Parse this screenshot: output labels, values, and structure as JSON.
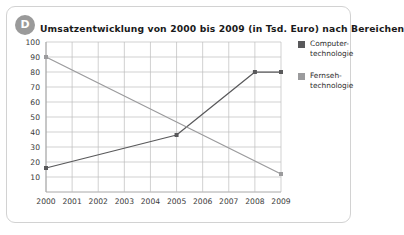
{
  "card": {
    "badge_letter": "D",
    "title": "Umsatzentwicklung von 2000 bis 2009 (in Tsd. Euro) nach Bereichen"
  },
  "legend": {
    "position": "right",
    "entries": [
      {
        "label": "Computer-\ntechnologie",
        "color": "#59595b"
      },
      {
        "label": "Fernseh-\ntechnologie",
        "color": "#9b9b9d"
      }
    ]
  },
  "chart_data": {
    "type": "line",
    "title": "Umsatzentwicklung von 2000 bis 2009 (in Tsd. Euro) nach Bereichen",
    "xlabel": "",
    "ylabel": "",
    "categories": [
      "2000",
      "2001",
      "2002",
      "2003",
      "2004",
      "2005",
      "2006",
      "2007",
      "2008",
      "2009"
    ],
    "ylim": [
      0,
      100
    ],
    "yticks": [
      10,
      20,
      30,
      40,
      50,
      60,
      70,
      80,
      90,
      100
    ],
    "ytick_labels": [
      "10",
      "20",
      "30",
      "40",
      "50",
      "60",
      "70",
      "80",
      "90",
      "100"
    ],
    "grid": true,
    "series": [
      {
        "name": "Computer-technologie",
        "color": "#59595b",
        "markers": true,
        "x": [
          "2000",
          "2005",
          "2008",
          "2009"
        ],
        "values": [
          16,
          38,
          80,
          80
        ]
      },
      {
        "name": "Fernseh-technologie",
        "color": "#9b9b9d",
        "markers": true,
        "x": [
          "2000",
          "2009"
        ],
        "values": [
          90,
          12
        ]
      }
    ]
  }
}
